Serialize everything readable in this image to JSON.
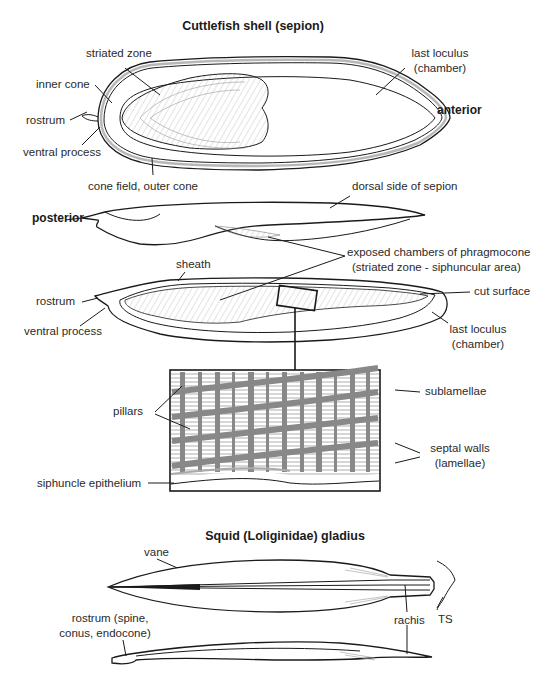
{
  "cuttlefish": {
    "title": "Cuttlefish shell (sepion)",
    "labels": {
      "striated_zone": "striated zone",
      "inner_cone": "inner cone",
      "rostrum": "rostrum",
      "ventral_process": "ventral process",
      "last_loculus_1": "last loculus",
      "last_loculus_2": "(chamber)",
      "anterior": "anterior",
      "cone_field": "cone field, outer cone",
      "dorsal_side": "dorsal side of sepion",
      "posterior": "posterior",
      "exposed_1": "exposed chambers of phragmocone",
      "exposed_2": "(striated zone - siphuncular area)",
      "sheath": "sheath",
      "rostrum_2": "rostrum",
      "ventral_process_2": "ventral process",
      "cut_surface": "cut surface",
      "last_loculus_b1": "last loculus",
      "last_loculus_b2": "(chamber)"
    }
  },
  "detail": {
    "labels": {
      "pillars": "pillars",
      "sublamellae": "sublamellae",
      "septal_walls_1": "septal walls",
      "septal_walls_2": "(lamellae)",
      "siphuncle": "siphuncle epithelium"
    }
  },
  "squid": {
    "title": "Squid (Loliginidae) gladius",
    "labels": {
      "vane": "vane",
      "rostrum_1": "rostrum (spine,",
      "rostrum_2": "conus, endocone)",
      "rachis": "rachis",
      "ts": "TS"
    }
  }
}
